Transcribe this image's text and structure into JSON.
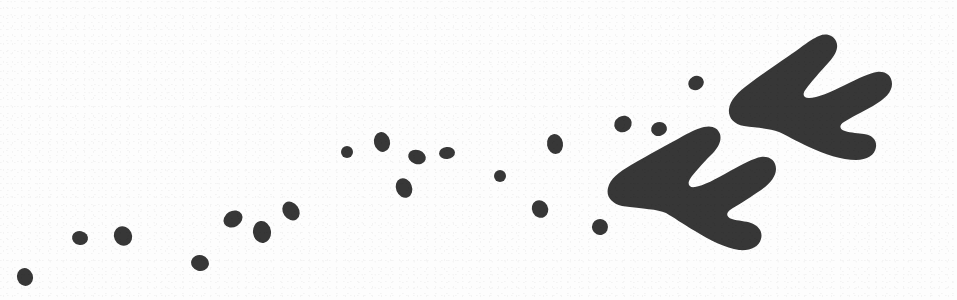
{
  "figure": {
    "canvas": {
      "width": 957,
      "height": 300
    },
    "colors": {
      "background": "#fdfdfd",
      "ink": "#373737",
      "ink_edge": "#2e2e2e"
    },
    "counts": {
      "large_footprints": 2,
      "small_impressions": 19
    }
  },
  "footprints": [
    {
      "name": "upper-right-footprint",
      "label": "Tridactyl track, right",
      "toes": 3,
      "orientation_deg": 200,
      "bbox": {
        "x": 726,
        "y": 33,
        "width": 163,
        "height": 101
      },
      "path": "M 744,126 C 733,124 728,117 729,109 C 730,100 738,92 749,84 C 765,72 786,58 800,48 C 808,42 814,38 819,36 C 826,33 833,35 836,41 C 839,47 836,54 829,62 C 820,72 811,82 806,89 C 802,94 803,98 809,98 C 817,98 831,92 845,85 C 859,78 870,73 877,72 C 886,71 892,76 892,84 C 892,92 885,99 873,106 C 862,112 850,118 844,122 C 839,125 839,129 845,131 C 851,133 859,133 864,134 C 872,135 877,140 876,147 C 875,155 867,160 856,160 C 842,160 824,154 809,147 C 796,141 786,135 779,132 C 770,128 757,128 744,126 Z"
    },
    {
      "name": "lower-left-footprint",
      "label": "Tridactyl track, left",
      "toes": 3,
      "orientation_deg": 200,
      "bbox": {
        "x": 607,
        "y": 158,
        "width": 168,
        "height": 104
      },
      "path": "M 622,206 C 611,203 606,196 608,188 C 610,179 619,172 631,165 C 648,155 669,144 683,136 C 692,131 699,128 704,127 C 712,125 718,128 720,134 C 722,141 718,148 711,155 C 702,164 694,173 690,179 C 687,184 689,188 695,187 C 703,186 716,179 730,171 C 743,164 754,158 761,157 C 770,156 776,161 776,169 C 776,177 769,185 758,192 C 748,199 736,206 730,210 C 726,213 726,217 732,219 C 738,221 746,221 751,223 C 759,226 763,232 761,239 C 759,247 750,251 739,250 C 726,248 709,240 695,231 C 683,224 673,217 666,213 C 657,209 644,209 622,206 Z"
    }
  ],
  "impressions": [
    {
      "name": "impression-1",
      "cx": 25,
      "cy": 277,
      "rx": 8,
      "ry": 9,
      "rot": -18
    },
    {
      "name": "impression-2",
      "cx": 80,
      "cy": 238,
      "rx": 8,
      "ry": 7,
      "rot": 12
    },
    {
      "name": "impression-3",
      "cx": 123,
      "cy": 236,
      "rx": 9,
      "ry": 10,
      "rot": -25
    },
    {
      "name": "impression-4",
      "cx": 200,
      "cy": 263,
      "rx": 9,
      "ry": 8,
      "rot": 15
    },
    {
      "name": "impression-5",
      "cx": 233,
      "cy": 219,
      "rx": 10,
      "ry": 8,
      "rot": -30
    },
    {
      "name": "impression-6",
      "cx": 262,
      "cy": 232,
      "rx": 9,
      "ry": 11,
      "rot": -8
    },
    {
      "name": "impression-7",
      "cx": 291,
      "cy": 211,
      "rx": 8,
      "ry": 10,
      "rot": -35
    },
    {
      "name": "impression-8",
      "cx": 382,
      "cy": 142,
      "rx": 8,
      "ry": 10,
      "rot": -12
    },
    {
      "name": "impression-9",
      "cx": 417,
      "cy": 157,
      "rx": 9,
      "ry": 7,
      "rot": 18
    },
    {
      "name": "impression-10",
      "cx": 447,
      "cy": 153,
      "rx": 8,
      "ry": 6,
      "rot": -5
    },
    {
      "name": "impression-11",
      "cx": 404,
      "cy": 188,
      "rx": 8,
      "ry": 10,
      "rot": -22
    },
    {
      "name": "impression-12",
      "cx": 555,
      "cy": 144,
      "rx": 8,
      "ry": 10,
      "rot": -10
    },
    {
      "name": "impression-13",
      "cx": 540,
      "cy": 209,
      "rx": 8,
      "ry": 9,
      "rot": -28
    },
    {
      "name": "impression-14",
      "cx": 600,
      "cy": 227,
      "rx": 8,
      "ry": 8,
      "rot": -20
    },
    {
      "name": "impression-15",
      "cx": 623,
      "cy": 124,
      "rx": 9,
      "ry": 8,
      "rot": -32
    },
    {
      "name": "impression-16",
      "cx": 659,
      "cy": 129,
      "rx": 8,
      "ry": 7,
      "rot": -15
    },
    {
      "name": "impression-17",
      "cx": 696,
      "cy": 83,
      "rx": 8,
      "ry": 7,
      "rot": -30
    },
    {
      "name": "impression-18",
      "cx": 347,
      "cy": 152,
      "rx": 6,
      "ry": 6,
      "rot": 0
    },
    {
      "name": "impression-19",
      "cx": 500,
      "cy": 176,
      "rx": 6,
      "ry": 6,
      "rot": 0
    }
  ]
}
